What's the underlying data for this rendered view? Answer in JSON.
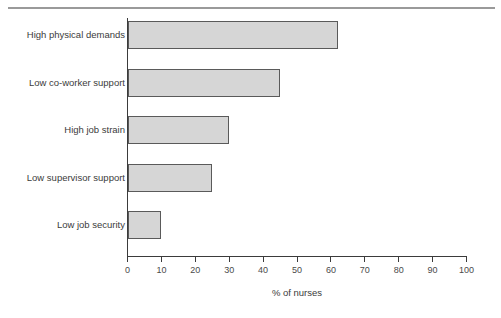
{
  "figure": {
    "background_color": "#ffffff",
    "rule_color": "#9a9a9a",
    "axis_color": "#3b3b3b",
    "bar_fill_color": "#d6d6d6",
    "bar_stroke_color": "#5a5a5a"
  },
  "chart_data": {
    "type": "bar",
    "orientation": "horizontal",
    "title": "",
    "xlabel": "% of nurses",
    "ylabel": "",
    "xlim": [
      0,
      100
    ],
    "xticks": [
      0,
      10,
      20,
      30,
      40,
      50,
      60,
      70,
      80,
      90,
      100
    ],
    "xtick_labels": [
      "0",
      "10",
      "20",
      "30",
      "40",
      "50",
      "60",
      "70",
      "80",
      "90",
      "100"
    ],
    "grid": false,
    "legend": null,
    "categories": [
      "High physical demands",
      "Low co-worker support",
      "High job strain",
      "Low supervisor support",
      "Low job security"
    ],
    "values": [
      62,
      45,
      30,
      25,
      10
    ],
    "series": [
      {
        "name": "% of nurses",
        "values": [
          62,
          45,
          30,
          25,
          10
        ]
      }
    ]
  }
}
